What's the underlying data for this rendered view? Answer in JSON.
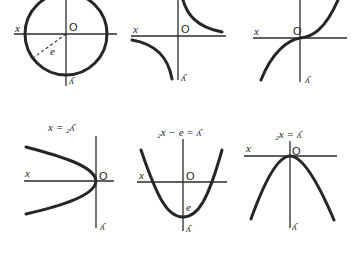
{
  "figure": {
    "panels": [
      {
        "id": "circle",
        "x_label": "x",
        "y_label": "ʎ",
        "origin_label": "O",
        "radius_label": "e",
        "equation": ""
      },
      {
        "id": "hyperbola",
        "x_label": "x",
        "y_label": "ʎ",
        "origin_label": "O",
        "equation": ""
      },
      {
        "id": "cubic",
        "x_label": "x",
        "y_label": "ʎ",
        "origin_label": "O",
        "equation": ""
      },
      {
        "id": "sideways-parabola",
        "x_label": "x",
        "y_label": "ʎ",
        "origin_label": "O",
        "equation": "x = ₂ʎ"
      },
      {
        "id": "upward-parabola",
        "x_label": "x",
        "y_label": "ʎ",
        "origin_label": "O",
        "intercept_label": "e",
        "equation": "₂x − e = ʎ"
      },
      {
        "id": "downward-parabola",
        "x_label": "x",
        "y_label": "ʎ",
        "origin_label": "O",
        "equation": "₂x = ʎ"
      }
    ]
  }
}
